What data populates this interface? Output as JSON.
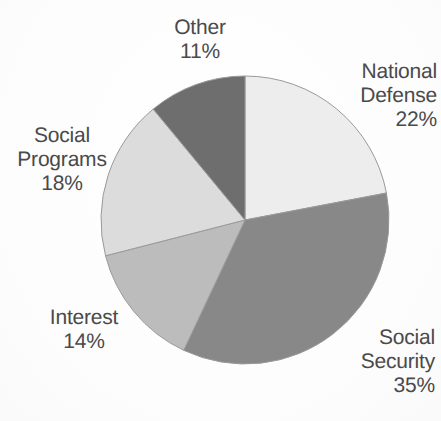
{
  "chart_data": {
    "type": "pie",
    "title": "",
    "subtitle": "",
    "xlabel": "",
    "ylabel": "",
    "legend_position": "none",
    "grid": false,
    "start_angle_deg": 0,
    "direction": "clockwise",
    "categories": [
      "National Defense",
      "Social Security",
      "Interest",
      "Social Programs",
      "Other"
    ],
    "values": [
      22,
      35,
      14,
      18,
      11
    ],
    "units": "percent",
    "total": 100,
    "slices": [
      {
        "label": "National Defense",
        "value": 22,
        "value_text": "22%",
        "color": "#ededed",
        "start_deg": 0,
        "end_deg": 79.2
      },
      {
        "label": "Social Security",
        "value": 35,
        "value_text": "35%",
        "color": "#888888",
        "start_deg": 79.2,
        "end_deg": 205.2
      },
      {
        "label": "Interest",
        "value": 14,
        "value_text": "14%",
        "color": "#bcbcbc",
        "start_deg": 205.2,
        "end_deg": 255.6
      },
      {
        "label": "Social Programs",
        "value": 18,
        "value_text": "18%",
        "color": "#dcdcdc",
        "start_deg": 255.6,
        "end_deg": 320.4
      },
      {
        "label": "Other",
        "value": 11,
        "value_text": "11%",
        "color": "#6e6e6e",
        "start_deg": 320.4,
        "end_deg": 360
      }
    ]
  },
  "labels": {
    "other": {
      "name": "Other",
      "percent": "11%"
    },
    "national_defense": {
      "name_line1": "National",
      "name_line2": "Defense",
      "percent": "22%"
    },
    "social_programs": {
      "name_line1": "Social",
      "name_line2": "Programs",
      "percent": "18%"
    },
    "interest": {
      "name": "Interest",
      "percent": "14%"
    },
    "social_security": {
      "name_line1": "Social",
      "name_line2": "Security",
      "percent": "35%"
    }
  },
  "style": {
    "text_color": "#4a4a4a",
    "background": "#fdfdfd",
    "slice_outline": "#9a9a9a"
  },
  "geometry": {
    "center_x": 245,
    "center_y": 220,
    "radius": 144
  }
}
